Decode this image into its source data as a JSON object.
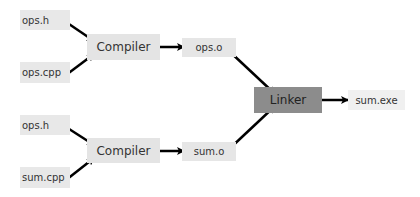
{
  "diagram": {
    "top": {
      "input1": "ops.h",
      "input2": "ops.cpp",
      "compiler": "Compiler",
      "output": "ops.o"
    },
    "bottom": {
      "input1": "ops.h",
      "input2": "sum.cpp",
      "compiler": "Compiler",
      "output": "sum.o"
    },
    "linker": "Linker",
    "final": "sum.exe",
    "colors": {
      "file_box": "#e8e8e8",
      "linker_box": "#8c8c8c",
      "arrow": "#000000"
    }
  }
}
